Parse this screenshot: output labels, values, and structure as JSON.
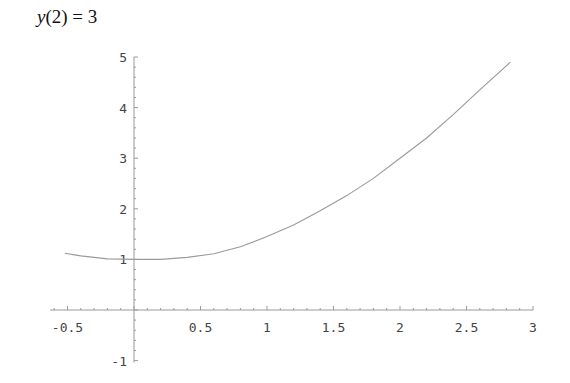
{
  "title": {
    "var": "y",
    "rest": "(2) = 3"
  },
  "colors": {
    "axis": "#9a9a9a",
    "curve": "#9a9a9a",
    "text": "#444444"
  },
  "chart_data": {
    "type": "line",
    "title": "y(2) = 3",
    "xlabel": "",
    "ylabel": "",
    "xlim": [
      -0.52,
      2.83
    ],
    "ylim": [
      -1,
      5
    ],
    "grid": false,
    "x_ticks": [
      -0.5,
      0.5,
      1,
      1.5,
      2,
      2.5,
      3
    ],
    "x_tick_labels": [
      "-0.5",
      "0.5",
      "1",
      "1.5",
      "2",
      "2.5",
      "3"
    ],
    "y_ticks": [
      -1,
      1,
      2,
      3,
      4,
      5
    ],
    "y_tick_labels": [
      "-1",
      "1",
      "2",
      "3",
      "4",
      "5"
    ],
    "series": [
      {
        "name": "y(x)",
        "x": [
          -0.52,
          -0.4,
          -0.2,
          0,
          0.2,
          0.4,
          0.6,
          0.8,
          1.0,
          1.2,
          1.4,
          1.6,
          1.8,
          2.0,
          2.2,
          2.4,
          2.6,
          2.83
        ],
        "y": [
          1.12,
          1.07,
          1.01,
          1.0,
          1.0,
          1.04,
          1.11,
          1.25,
          1.45,
          1.68,
          1.96,
          2.26,
          2.6,
          3.0,
          3.4,
          3.86,
          4.35,
          4.9
        ]
      }
    ],
    "annotations": []
  }
}
